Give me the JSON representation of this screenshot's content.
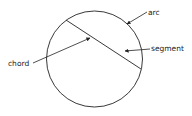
{
  "diagram": {
    "labels": {
      "arc": "arc",
      "segment": "segment",
      "chord": "chord"
    },
    "colors": {
      "stroke": "#222222",
      "background": "#ffffff"
    }
  }
}
